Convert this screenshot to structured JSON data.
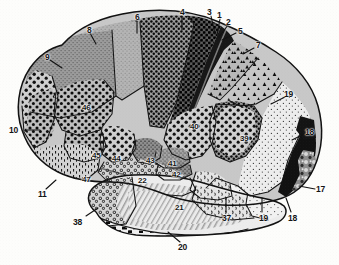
{
  "figure": {
    "kind": "brodmann-cytoarchitectonic-map",
    "view": "lateral",
    "background_color": "#fdfdfb",
    "ink_color": "#141414",
    "width": 339,
    "height": 265
  },
  "labels": [
    {
      "id": "3",
      "text": "3",
      "x": 207,
      "y": 8,
      "kind": "leader",
      "leader": [
        211,
        16,
        215,
        34
      ]
    },
    {
      "id": "1",
      "text": "1",
      "x": 217,
      "y": 11,
      "kind": "leader",
      "leader": [
        220,
        19,
        217,
        35
      ]
    },
    {
      "id": "2",
      "text": "2",
      "x": 226,
      "y": 18,
      "kind": "leader",
      "leader": [
        228,
        25,
        219,
        37
      ]
    },
    {
      "id": "4",
      "text": "4",
      "x": 180,
      "y": 8,
      "kind": "leader",
      "leader": [
        182,
        16,
        182,
        30
      ]
    },
    {
      "id": "5",
      "text": "5",
      "x": 238,
      "y": 27,
      "kind": "leader",
      "leader": [
        236,
        33,
        222,
        40
      ]
    },
    {
      "id": "6",
      "text": "6",
      "x": 135,
      "y": 13,
      "kind": "leader",
      "leader": [
        137,
        21,
        137,
        33
      ]
    },
    {
      "id": "7",
      "text": "7",
      "x": 256,
      "y": 41,
      "kind": "leader",
      "leader": [
        254,
        48,
        243,
        54
      ]
    },
    {
      "id": "8",
      "text": "8",
      "x": 87,
      "y": 26,
      "kind": "leader",
      "leader": [
        90,
        33,
        96,
        44
      ]
    },
    {
      "id": "9",
      "text": "9",
      "x": 45,
      "y": 53,
      "kind": "leader",
      "leader": [
        50,
        60,
        62,
        68
      ]
    },
    {
      "id": "10",
      "text": "10",
      "x": 9,
      "y": 126,
      "kind": "leader",
      "leader": [
        26,
        130,
        40,
        130
      ]
    },
    {
      "id": "11",
      "text": "11",
      "x": 38,
      "y": 190,
      "kind": "leader",
      "leader": [
        46,
        189,
        56,
        180
      ]
    },
    {
      "id": "17",
      "text": "17",
      "x": 316,
      "y": 185,
      "kind": "leader",
      "leader": [
        315,
        189,
        299,
        186
      ]
    },
    {
      "id": "18",
      "text": "18",
      "x": 305,
      "y": 128,
      "kind": "leader",
      "leader": [
        304,
        134,
        292,
        140
      ]
    },
    {
      "id": "18b",
      "text": "18",
      "x": 288,
      "y": 214,
      "kind": "leader",
      "leader": [
        291,
        212,
        286,
        198
      ]
    },
    {
      "id": "19",
      "text": "19",
      "x": 284,
      "y": 90,
      "kind": "leader",
      "leader": [
        285,
        97,
        271,
        104
      ]
    },
    {
      "id": "19b",
      "text": "19",
      "x": 259,
      "y": 214,
      "kind": "leader",
      "leader": [
        262,
        212,
        262,
        198
      ]
    },
    {
      "id": "20",
      "text": "20",
      "x": 178,
      "y": 243,
      "kind": "leader",
      "leader": [
        180,
        242,
        168,
        232
      ]
    },
    {
      "id": "37",
      "text": "37",
      "x": 222,
      "y": 214,
      "kind": "leader",
      "leader": [
        226,
        212,
        226,
        198
      ]
    },
    {
      "id": "38",
      "text": "38",
      "x": 73,
      "y": 218,
      "kind": "leader",
      "leader": [
        86,
        216,
        98,
        208
      ]
    },
    {
      "id": "21",
      "text": "21",
      "x": 175,
      "y": 204,
      "kind": "inner"
    },
    {
      "id": "22",
      "text": "22",
      "x": 138,
      "y": 177,
      "kind": "inner"
    },
    {
      "id": "39",
      "text": "39",
      "x": 240,
      "y": 135,
      "kind": "inner"
    },
    {
      "id": "40",
      "text": "40",
      "x": 190,
      "y": 123,
      "kind": "inner"
    },
    {
      "id": "41",
      "text": "41",
      "x": 168,
      "y": 160,
      "kind": "inner"
    },
    {
      "id": "42",
      "text": "42",
      "x": 172,
      "y": 171,
      "kind": "inner"
    },
    {
      "id": "43",
      "text": "43",
      "x": 146,
      "y": 157,
      "kind": "inner"
    },
    {
      "id": "44",
      "text": "44",
      "x": 112,
      "y": 155,
      "kind": "inner"
    },
    {
      "id": "45",
      "text": "45",
      "x": 92,
      "y": 152,
      "kind": "inner",
      "leader": [
        103,
        150,
        104,
        137
      ]
    },
    {
      "id": "46",
      "text": "46",
      "x": 82,
      "y": 104,
      "kind": "inner"
    },
    {
      "id": "47",
      "text": "47",
      "x": 82,
      "y": 176,
      "kind": "inner"
    }
  ],
  "regions": [
    {
      "id": "r9",
      "name": "area-9",
      "tone": "#8e8e8e",
      "texture": "fine-stipple"
    },
    {
      "id": "r8",
      "name": "area-8",
      "tone": "#9a9a9a",
      "texture": "coarse-dots"
    },
    {
      "id": "r6",
      "name": "area-6",
      "tone": "#4a4a4a",
      "texture": "dense-dots"
    },
    {
      "id": "r4",
      "name": "area-4",
      "tone": "#222222",
      "texture": "solid-dots"
    },
    {
      "id": "r3",
      "name": "area-3",
      "tone": "#1a1a1a",
      "texture": "solid-band"
    },
    {
      "id": "r1",
      "name": "area-1",
      "tone": "#262626",
      "texture": "solid-band"
    },
    {
      "id": "r2",
      "name": "area-2",
      "tone": "#303030",
      "texture": "solid-band"
    },
    {
      "id": "r5",
      "name": "area-5",
      "tone": "#7b7b7b",
      "texture": "triangles"
    },
    {
      "id": "r7",
      "name": "area-7",
      "tone": "#8a8a8a",
      "texture": "triangles"
    },
    {
      "id": "r19",
      "name": "area-19",
      "tone": "#e2e2e2",
      "texture": "sparse-stipple"
    },
    {
      "id": "r18",
      "name": "area-18",
      "tone": "#1a1a1a",
      "texture": "solid-black"
    },
    {
      "id": "r17",
      "name": "area-17",
      "tone": "#9c9c9c",
      "texture": "mottled"
    },
    {
      "id": "r39",
      "name": "area-39",
      "tone": "#3a3a3a",
      "texture": "coarse-dots"
    },
    {
      "id": "r40",
      "name": "area-40",
      "tone": "#4a4a4a",
      "texture": "coarse-dots"
    },
    {
      "id": "r46",
      "name": "area-46",
      "tone": "#7a7a7a",
      "texture": "coarse-dots"
    },
    {
      "id": "r45",
      "name": "area-45",
      "tone": "#6e6e6e",
      "texture": "coarse-dots"
    },
    {
      "id": "r44",
      "name": "area-44",
      "tone": "#7d7d7d",
      "texture": "coarse-dots"
    },
    {
      "id": "r10",
      "name": "area-10",
      "tone": "#5f5f5f",
      "texture": "coarse-dots"
    },
    {
      "id": "r11",
      "name": "area-11",
      "tone": "#8d8d8d",
      "texture": "dash-stipple"
    },
    {
      "id": "r47",
      "name": "area-47",
      "tone": "#8d8d8d",
      "texture": "dash-stipple"
    },
    {
      "id": "r38",
      "name": "area-38",
      "tone": "#9f9f9f",
      "texture": "ring-dots"
    },
    {
      "id": "r22",
      "name": "area-22",
      "tone": "#9a9a9a",
      "texture": "ring-dots"
    },
    {
      "id": "r21",
      "name": "area-21",
      "tone": "#dcdcdc",
      "texture": "diagonal-hatch"
    },
    {
      "id": "r20",
      "name": "area-20",
      "tone": "#2a2a2a",
      "texture": "block-dashes"
    },
    {
      "id": "r37",
      "name": "area-37",
      "tone": "#cfcfcf",
      "texture": "comma-stipple"
    },
    {
      "id": "r41",
      "name": "area-41",
      "tone": "#b5b5b5",
      "texture": "fine-stipple"
    },
    {
      "id": "r42",
      "name": "area-42",
      "tone": "#8f8f8f",
      "texture": "fine-stipple"
    },
    {
      "id": "r43",
      "name": "area-43",
      "tone": "#707070",
      "texture": "fine-stipple"
    }
  ]
}
